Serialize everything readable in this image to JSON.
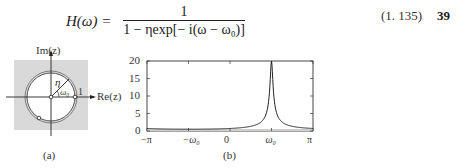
{
  "equation": {
    "lhs": "H(ω) =",
    "numerator": "1",
    "denominator": "1 − ηexp[− i(ω − ω₀)]",
    "number": "(1. 135)"
  },
  "page_number": "39",
  "figure_a": {
    "caption": "(a)",
    "axis_re_label": "Re(z)",
    "axis_im_label": "Im(z)",
    "radius_label": "η",
    "angle_label": "ω₀",
    "unit_label": "1"
  },
  "figure_b": {
    "caption": "(b)",
    "y_ticks": [
      "20",
      "15",
      "10",
      "5",
      "0"
    ],
    "x_ticks": [
      "−π",
      "−ω₀",
      "0",
      "ω₀",
      "π"
    ]
  },
  "chart_data": {
    "type": "line",
    "title": "",
    "xlabel": "",
    "ylabel": "",
    "x_tick_labels": [
      "−π",
      "−ω₀",
      "0",
      "ω₀",
      "π"
    ],
    "x_tick_values": [
      -3.1416,
      -1.5708,
      0,
      1.5708,
      3.1416
    ],
    "y_tick_values": [
      0,
      5,
      10,
      15,
      20
    ],
    "xlim": [
      -3.1416,
      3.1416
    ],
    "ylim": [
      0,
      20
    ],
    "grid": false,
    "series": [
      {
        "name": "|H(ω)|",
        "x": [
          -3.14,
          -2.5,
          -2.0,
          -1.5708,
          -1.0,
          -0.5,
          0,
          0.5,
          0.8,
          1.0,
          1.2,
          1.35,
          1.45,
          1.52,
          1.5708,
          1.62,
          1.7,
          1.8,
          2.0,
          2.4,
          2.8,
          3.14
        ],
        "y": [
          0.51,
          0.52,
          0.53,
          0.53,
          0.56,
          0.6,
          0.7,
          0.9,
          1.2,
          1.6,
          2.4,
          3.9,
          6.8,
          12.5,
          20.0,
          12.5,
          6.8,
          3.9,
          2.1,
          1.1,
          0.8,
          0.7
        ]
      }
    ]
  }
}
